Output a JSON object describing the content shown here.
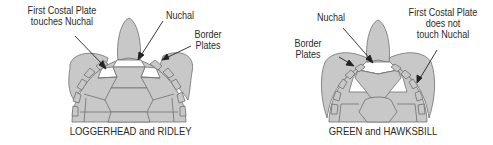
{
  "diagrams": [
    {
      "caption": "LOGGERHEAD and RIDLEY",
      "labels": {
        "first_costal_line1": "First Costal Plate",
        "first_costal_line2": "touches Nuchal",
        "nuchal": "Nuchal",
        "border_line1": "Border",
        "border_line2": "Plates"
      }
    },
    {
      "caption": "GREEN and HAWKSBILL",
      "labels": {
        "nuchal": "Nuchal",
        "border_line1": "Border",
        "border_line2": "Plates",
        "first_costal_line1": "First Costal Plate",
        "first_costal_line2": "does not",
        "first_costal_line3": "touch Nuchal"
      }
    }
  ],
  "colors": {
    "shell_fill": "#c8c8c8",
    "outline": "#6e6e6e",
    "highlight": "#ffffff",
    "text": "#2a2a2a"
  }
}
